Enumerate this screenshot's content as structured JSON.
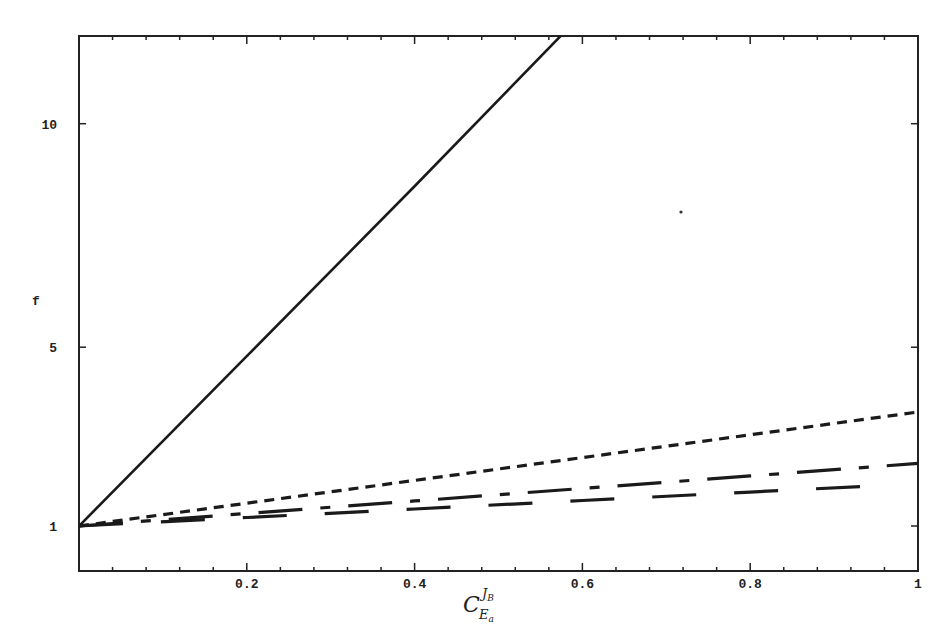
{
  "chart_data": {
    "type": "line",
    "title": "",
    "xlabel": "C_{E_a}^{J_B}",
    "xlabel_parts": {
      "main": "C",
      "sub": "E",
      "subsub": "a",
      "sup": "J",
      "supsub": "B"
    },
    "ylabel": "f",
    "xlim": [
      0,
      1
    ],
    "ylim": [
      0,
      12
    ],
    "x_ticks": [
      0.2,
      0.4,
      0.6,
      0.8,
      1
    ],
    "x_tick_labels": [
      "0.2",
      "0.4",
      "0.6",
      "0.8",
      "1"
    ],
    "x_minor_step": 0.04,
    "y_ticks": [
      1,
      5,
      10
    ],
    "y_tick_labels": [
      "1",
      "5",
      "10"
    ],
    "grid": false,
    "legend": null,
    "series": [
      {
        "name": "solid",
        "style": "solid",
        "x": [
          0,
          0.2,
          0.4,
          0.576
        ],
        "values": [
          1,
          4.8,
          8.6,
          12
        ]
      },
      {
        "name": "short-dash",
        "style": "short-dash",
        "x": [
          0,
          0.2,
          0.4,
          0.6,
          0.8,
          1
        ],
        "values": [
          1,
          1.51,
          2.02,
          2.53,
          3.04,
          3.55
        ]
      },
      {
        "name": "long-dash-dot",
        "style": "long-dash-dot",
        "x": [
          0,
          0.2,
          0.4,
          0.6,
          0.8,
          1
        ],
        "values": [
          1,
          1.28,
          1.56,
          1.84,
          2.12,
          2.4
        ]
      },
      {
        "name": "long-dash",
        "style": "long-dash",
        "x": [
          0,
          0.2,
          0.4,
          0.6,
          0.8,
          0.95
        ],
        "values": [
          1,
          1.19,
          1.38,
          1.57,
          1.76,
          1.9
        ]
      }
    ]
  }
}
